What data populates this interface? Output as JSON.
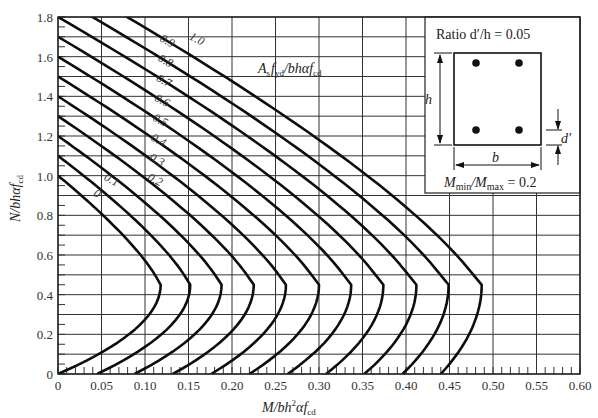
{
  "chart_data": {
    "type": "line",
    "title": "",
    "xlabel": "M/bh²αf_cd",
    "ylabel": "N/bhαf_cd",
    "xlim": [
      0,
      0.6
    ],
    "ylim": [
      0,
      1.8
    ],
    "grid": true,
    "x_ticks": [
      "0",
      "0.05",
      "0.10",
      "0.15",
      "0.20",
      "0.25",
      "0.30",
      "0.35",
      "0.40",
      "0.45",
      "0.50",
      "0.55",
      "0.60"
    ],
    "y_ticks": [
      "0",
      "0.2",
      "0.4",
      "0.6",
      "0.8",
      "1.0",
      "1.2",
      "1.4",
      "1.6",
      "1.8"
    ],
    "family_label": "A_s f_yd / bhαf_cd",
    "series": [
      {
        "name": "0",
        "base_m": 0.0,
        "peak_m": 0.118,
        "top_n": 1.0
      },
      {
        "name": "0.1",
        "base_m": 0.045,
        "peak_m": 0.152,
        "top_n": 1.1
      },
      {
        "name": "0.2",
        "base_m": 0.088,
        "peak_m": 0.188,
        "top_n": 1.2
      },
      {
        "name": "0.3",
        "base_m": 0.132,
        "peak_m": 0.225,
        "top_n": 1.3
      },
      {
        "name": "0.4",
        "base_m": 0.176,
        "peak_m": 0.262,
        "top_n": 1.4
      },
      {
        "name": "0.5",
        "base_m": 0.22,
        "peak_m": 0.3,
        "top_n": 1.5
      },
      {
        "name": "0.6",
        "base_m": 0.264,
        "peak_m": 0.337,
        "top_n": 1.6
      },
      {
        "name": "0.7",
        "base_m": 0.308,
        "peak_m": 0.374,
        "top_n": 1.7
      },
      {
        "name": "0.8",
        "base_m": 0.352,
        "peak_m": 0.412,
        "top_n": 1.8
      },
      {
        "name": "0.9",
        "base_m": 0.396,
        "peak_m": 0.449,
        "top_n": 1.9
      },
      {
        "name": "1.0",
        "base_m": 0.44,
        "peak_m": 0.487,
        "top_n": 2.0
      }
    ],
    "peak_n": 0.45,
    "inset": {
      "ratio_text": "Ratio d′/h = 0.05",
      "h_label": "h",
      "b_label": "b",
      "d_label": "d′",
      "moment_ratio_text": "M_min / M_max = 0.2"
    }
  },
  "labels": {
    "xlabel_main": "M/bh",
    "xlabel_sup": "2",
    "xlabel_rest": "αf",
    "xlabel_sub": "cd",
    "ylabel_main": "N/bhαf",
    "ylabel_sub": "cd",
    "family_main": "A",
    "family_s": "s",
    "family_f": "f",
    "family_yd": "yd",
    "family_rest": "/bhαf",
    "family_cd": "cd",
    "ratio_text": "Ratio d′/h = 0.05",
    "h": "h",
    "b": "b",
    "d": "d′",
    "mmin_M": "M",
    "mmin_sub": "min",
    "mmax_M": "/M",
    "mmax_sub": "max",
    "mratio_val": " = 0.2"
  }
}
